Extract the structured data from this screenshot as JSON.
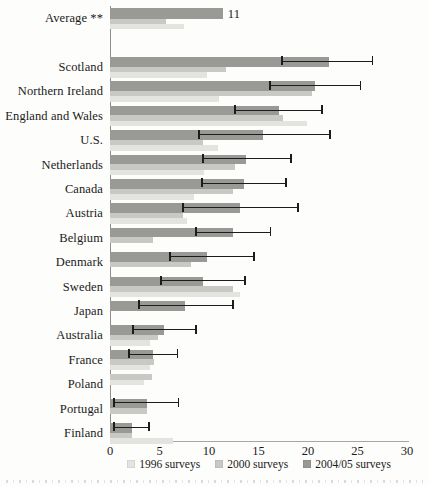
{
  "figure": {
    "background": "#fdfdfb",
    "axis_color": "#a6a6a3",
    "error_bar_color": "#1c1c1c"
  },
  "chart_data": {
    "type": "bar",
    "orientation": "horizontal",
    "title": "",
    "xlabel": "",
    "ylabel": "",
    "xlim": [
      0,
      30
    ],
    "x_ticks": [
      "0",
      "5",
      "10",
      "15",
      "20",
      "25",
      "30"
    ],
    "grid": false,
    "legend_position": "bottom",
    "series": [
      {
        "key": "v1996",
        "name": "1996 surveys",
        "color": "#e3e3e0"
      },
      {
        "key": "v2000",
        "name": "2000 surveys",
        "color": "#c8c8c5"
      },
      {
        "key": "v2004",
        "name": "2004/05 surveys",
        "color": "#99999640"
      }
    ],
    "series_colors": {
      "v1996": "#e3e3e0",
      "v2000": "#c8c8c5",
      "v2004": "#999996"
    },
    "note": "v2004 bars carry confidence-interval error bars [low, high]; Average bar is annotated with its value",
    "rows": [
      {
        "label": "Average **",
        "v2004": 11.4,
        "bar_label": "11",
        "ci": null,
        "v2000": 5.7,
        "v1996": 7.5,
        "gap_after": true
      },
      {
        "label": "Scotland",
        "v2004": 22.1,
        "ci": [
          17.3,
          26.6
        ],
        "v2000": 11.7,
        "v1996": 9.8
      },
      {
        "label": "Northern Ireland",
        "v2004": 20.7,
        "ci": [
          16.1,
          25.4
        ],
        "v2000": 20.4,
        "v1996": 11.0
      },
      {
        "label": "England and Wales",
        "v2004": 17.1,
        "ci": [
          12.5,
          21.5
        ],
        "v2000": 17.5,
        "v1996": 19.9
      },
      {
        "label": "U.S.",
        "v2004": 15.5,
        "ci": [
          8.9,
          22.3
        ],
        "v2000": 9.4,
        "v1996": 10.9
      },
      {
        "label": "Netherlands",
        "v2004": 13.7,
        "ci": [
          9.3,
          18.4
        ],
        "v2000": 12.6,
        "v1996": 9.5
      },
      {
        "label": "Canada",
        "v2004": 13.5,
        "ci": [
          9.2,
          17.9
        ],
        "v2000": 12.4,
        "v1996": 8.5
      },
      {
        "label": "Austria",
        "v2004": 13.1,
        "ci": [
          7.3,
          19.1
        ],
        "v2000": 7.4,
        "v1996": 7.8
      },
      {
        "label": "Belgium",
        "v2004": 12.4,
        "ci": [
          8.6,
          16.3
        ],
        "v2000": 4.3,
        "v1996": null
      },
      {
        "label": "Denmark",
        "v2004": 9.8,
        "ci": [
          6.0,
          14.6
        ],
        "v2000": 8.2,
        "v1996": null
      },
      {
        "label": "Sweden",
        "v2004": 9.4,
        "ci": [
          5.1,
          13.7
        ],
        "v2000": 12.4,
        "v1996": 13.1
      },
      {
        "label": "Japan",
        "v2004": 7.6,
        "ci": [
          2.8,
          12.5
        ],
        "v2000": null,
        "v1996": null
      },
      {
        "label": "Australia",
        "v2004": 5.5,
        "ci": [
          2.2,
          8.8
        ],
        "v2000": 4.8,
        "v1996": 4.0
      },
      {
        "label": "France",
        "v2004": 4.3,
        "ci": [
          1.8,
          6.9
        ],
        "v2000": 4.4,
        "v1996": 4.0
      },
      {
        "label": "Poland",
        "v2004": null,
        "ci": null,
        "v2000": 4.2,
        "v1996": 3.4
      },
      {
        "label": "Portugal",
        "v2004": 3.7,
        "ci": [
          0.3,
          7.0
        ],
        "v2000": 3.7,
        "v1996": null
      },
      {
        "label": "Finland",
        "v2004": 2.2,
        "ci": [
          0.3,
          4.0
        ],
        "v2000": 2.2,
        "v1996": 6.4
      }
    ],
    "legend_entries": [
      "1996 surveys",
      "2000 surveys",
      "2004/05 surveys"
    ]
  }
}
